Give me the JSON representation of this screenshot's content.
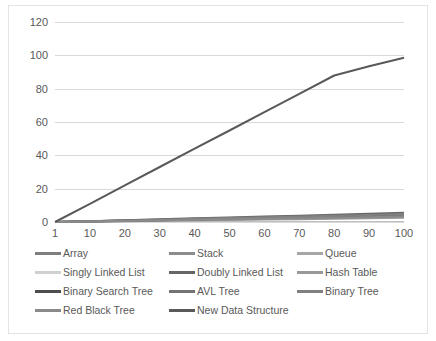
{
  "chart_data": {
    "type": "line",
    "title": "",
    "xlabel": "",
    "ylabel": "",
    "grid": true,
    "legend_position": "bottom",
    "legend_columns": 3,
    "x": [
      1,
      10,
      20,
      30,
      40,
      50,
      60,
      70,
      80,
      90,
      100
    ],
    "xtick_labels": [
      "1",
      "10",
      "20",
      "30",
      "40",
      "50",
      "60",
      "70",
      "80",
      "90",
      "100"
    ],
    "ytick_labels": [
      "0",
      "20",
      "40",
      "60",
      "80",
      "100",
      "120"
    ],
    "yticks": [
      0,
      20,
      40,
      60,
      80,
      100,
      120
    ],
    "ylim": [
      0,
      120
    ],
    "series": [
      {
        "name": "Array",
        "color": "#7f7f7f",
        "values": [
          0,
          0.4,
          0.9,
          1.3,
          1.8,
          2.2,
          2.6,
          3.1,
          3.5,
          4.0,
          4.4
        ]
      },
      {
        "name": "Stack",
        "color": "#8c8c8c",
        "values": [
          0,
          0.3,
          0.7,
          1.0,
          1.4,
          1.7,
          2.0,
          2.4,
          2.7,
          3.1,
          3.4
        ]
      },
      {
        "name": "Queue",
        "color": "#a6a6a6",
        "values": [
          0,
          0.3,
          0.6,
          0.9,
          1.2,
          1.5,
          1.8,
          2.1,
          2.4,
          2.7,
          3.0
        ]
      },
      {
        "name": "Singly Linked List",
        "color": "#d0d0d0",
        "values": [
          0,
          0.5,
          1.0,
          1.5,
          2.0,
          2.5,
          3.0,
          3.5,
          4.0,
          4.5,
          5.0
        ]
      },
      {
        "name": "Doubly Linked List",
        "color": "#666666",
        "values": [
          0,
          0.5,
          1.1,
          1.6,
          2.2,
          2.7,
          3.3,
          3.8,
          4.4,
          4.9,
          5.5
        ]
      },
      {
        "name": "Hash Table",
        "color": "#999999",
        "values": [
          0,
          0.2,
          0.5,
          0.7,
          1.0,
          1.2,
          1.5,
          1.7,
          2.0,
          2.2,
          2.5
        ]
      },
      {
        "name": "Binary Search Tree",
        "color": "#4d4d4d",
        "values": [
          0,
          0.4,
          0.8,
          1.2,
          1.6,
          2.0,
          2.4,
          2.8,
          3.2,
          3.6,
          4.0
        ]
      },
      {
        "name": "AVL Tree",
        "color": "#737373",
        "values": [
          0,
          0.35,
          0.75,
          1.1,
          1.5,
          1.85,
          2.25,
          2.6,
          3.0,
          3.35,
          3.75
        ]
      },
      {
        "name": "Binary Tree",
        "color": "#808080",
        "values": [
          0,
          0.45,
          0.95,
          1.4,
          1.9,
          2.35,
          2.85,
          3.3,
          3.8,
          4.25,
          4.75
        ]
      },
      {
        "name": "Red Black Tree",
        "color": "#8a8a8a",
        "values": [
          0,
          0.3,
          0.65,
          0.95,
          1.3,
          1.6,
          1.95,
          2.25,
          2.6,
          2.9,
          3.25
        ]
      },
      {
        "name": "New Data Structure",
        "color": "#595959",
        "values": [
          0,
          10.9,
          22.0,
          33.0,
          44.0,
          54.9,
          65.9,
          76.9,
          87.9,
          93.5,
          98.5
        ]
      }
    ]
  },
  "legend": {
    "items": [
      {
        "label": "Array"
      },
      {
        "label": "Stack"
      },
      {
        "label": "Queue"
      },
      {
        "label": "Singly Linked List"
      },
      {
        "label": "Doubly Linked List"
      },
      {
        "label": "Hash Table"
      },
      {
        "label": "Binary Search Tree"
      },
      {
        "label": "AVL Tree"
      },
      {
        "label": "Binary Tree"
      },
      {
        "label": "Red Black Tree"
      },
      {
        "label": "New Data Structure"
      }
    ]
  }
}
